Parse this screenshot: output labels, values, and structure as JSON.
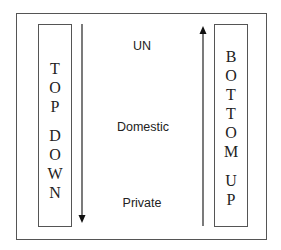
{
  "diagram": {
    "left_box": {
      "letters": [
        "T",
        "O",
        "P",
        "",
        "D",
        "O",
        "W",
        "N"
      ],
      "label": "TOP DOWN"
    },
    "right_box": {
      "letters": [
        "B",
        "O",
        "T",
        "T",
        "O",
        "M",
        "",
        "U",
        "P"
      ],
      "label": "BOTTOM UP"
    },
    "levels": [
      {
        "label": "UN"
      },
      {
        "label": "Domestic"
      },
      {
        "label": "Private"
      }
    ],
    "left_arrow": {
      "direction": "down"
    },
    "right_arrow": {
      "direction": "up"
    },
    "colors": {
      "stroke": "#555555",
      "text": "#222222"
    }
  }
}
